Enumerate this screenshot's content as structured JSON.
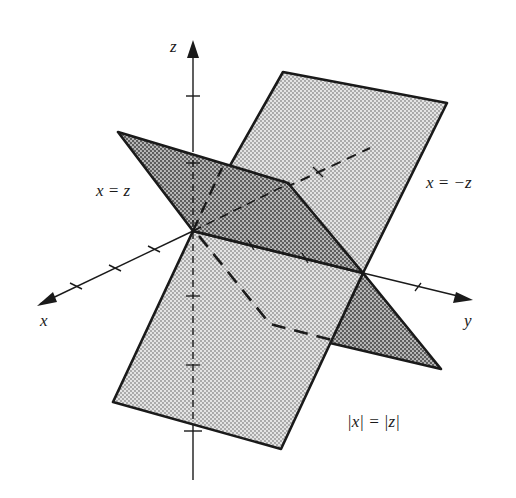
{
  "figure": {
    "colors": {
      "light_plane": "#d2d2d2",
      "dark_plane": "#a9a9a9",
      "stroke": "#1a1a1a",
      "background": "#ffffff"
    }
  },
  "axes": {
    "x": {
      "label": "x"
    },
    "y": {
      "label": "y"
    },
    "z": {
      "label": "z"
    }
  },
  "labels": {
    "plane_x_eq_z": "x = z",
    "plane_x_eq_neg_z": "x = −z",
    "union": "|x| = |z|"
  },
  "geometry": {
    "origin": [
      193,
      231
    ],
    "y_axis_meet": [
      363,
      273
    ],
    "light_plane_top": [
      [
        193,
        231
      ],
      [
        283,
        72
      ],
      [
        447,
        103
      ],
      [
        363,
        273
      ]
    ],
    "light_plane_bottom": [
      [
        193,
        231
      ],
      [
        113,
        402
      ],
      [
        281,
        449
      ],
      [
        363,
        273
      ]
    ],
    "dark_plane_upper": [
      [
        193,
        231
      ],
      [
        118,
        132
      ],
      [
        288,
        183
      ],
      [
        363,
        273
      ]
    ],
    "dark_plane_lower_tip": [
      [
        363,
        273
      ],
      [
        441,
        369
      ],
      [
        330,
        343
      ]
    ]
  }
}
